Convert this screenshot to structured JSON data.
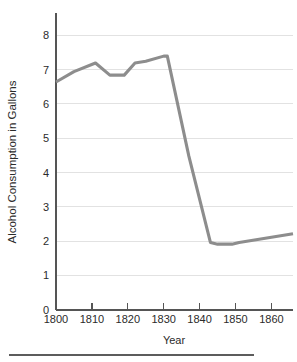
{
  "chart_data": {
    "type": "line",
    "title": "",
    "xlabel": "Year",
    "ylabel": "Alcohol Consumption in Gallons",
    "xlim": [
      1800,
      1866
    ],
    "ylim": [
      0,
      8.6
    ],
    "xticks": [
      1800,
      1810,
      1820,
      1830,
      1840,
      1850,
      1860
    ],
    "xtick_labels": [
      "1800",
      "1810",
      "1820",
      "1830",
      "1840",
      "1850",
      "1860"
    ],
    "yticks": [
      0,
      1,
      2,
      3,
      4,
      5,
      6,
      7,
      8
    ],
    "ytick_labels": [
      "0",
      "1",
      "2",
      "3",
      "4",
      "5",
      "6",
      "7",
      "8"
    ],
    "grid": true,
    "grid_axis": "y",
    "legend": false,
    "series": [
      {
        "name": "Alcohol Consumption",
        "color": "#8d8d8d",
        "x": [
          1800,
          1805,
          1811,
          1815,
          1819,
          1822,
          1825,
          1830,
          1831,
          1837,
          1843,
          1845,
          1849,
          1851,
          1860,
          1866
        ],
        "values": [
          6.6,
          6.9,
          7.15,
          6.8,
          6.8,
          7.15,
          7.2,
          7.35,
          7.35,
          4.45,
          1.95,
          1.9,
          1.9,
          1.95,
          2.1,
          2.2
        ]
      }
    ]
  },
  "axes": {
    "y_title": "Alcohol Consumption in Gallons",
    "x_title": "Year"
  },
  "footer": {
    "rule": "horizontal-rule"
  }
}
